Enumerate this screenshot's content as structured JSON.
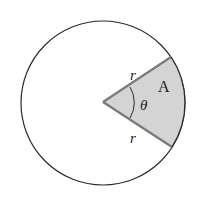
{
  "diagram": {
    "labels": {
      "radius_top": "r",
      "radius_bottom": "r",
      "angle": "θ",
      "area": "A"
    },
    "colors": {
      "circle_stroke": "#2a2a2a",
      "sector_fill": "#d4d4d4",
      "sector_edge": "#7a7a7a",
      "background": "#ffffff"
    }
  }
}
